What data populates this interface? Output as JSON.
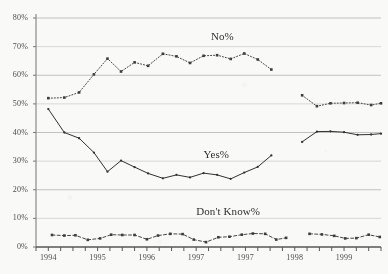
{
  "chart_data": {
    "type": "line",
    "title": "",
    "subtitle": "",
    "xlabel": "",
    "ylabel": "",
    "ylim": [
      0,
      80
    ],
    "xlim": [
      0,
      28
    ],
    "grid": true,
    "legend_position": "inline-annotations",
    "ytick_labels": [
      "0%",
      "10%",
      "20%",
      "30%",
      "40%",
      "50%",
      "60%",
      "70%",
      "80%"
    ],
    "ytick_values": [
      0,
      10,
      20,
      30,
      40,
      50,
      60,
      70,
      80
    ],
    "xtick_labels": [
      "1994",
      "1995",
      "1996",
      "1997",
      "1997",
      "1998",
      "1999"
    ],
    "xtick_positions": [
      1,
      5,
      9,
      13,
      17,
      21,
      25
    ],
    "annotations": [
      {
        "text": "No%",
        "x": 14.2,
        "y": 73.5
      },
      {
        "text": "Yes%",
        "x": 13.6,
        "y": 32.0
      },
      {
        "text": "Don't Know%",
        "x": 13.0,
        "y": 12.4
      }
    ],
    "series": [
      {
        "name": "No%",
        "style": "dotted",
        "marker": "square",
        "color": "#3a3a3a",
        "points": [
          {
            "x": 1.0,
            "y": 52.0
          },
          {
            "x": 2.3,
            "y": 52.2
          },
          {
            "x": 3.5,
            "y": 54.0
          },
          {
            "x": 4.7,
            "y": 60.3
          },
          {
            "x": 5.8,
            "y": 65.8
          },
          {
            "x": 6.9,
            "y": 61.3
          },
          {
            "x": 8.0,
            "y": 64.5
          },
          {
            "x": 9.1,
            "y": 63.3
          },
          {
            "x": 10.3,
            "y": 67.5
          },
          {
            "x": 11.4,
            "y": 66.6
          },
          {
            "x": 12.5,
            "y": 64.3
          },
          {
            "x": 13.6,
            "y": 66.8
          },
          {
            "x": 14.7,
            "y": 67.0
          },
          {
            "x": 15.8,
            "y": 65.7
          },
          {
            "x": 16.9,
            "y": 67.6
          },
          {
            "x": 18.0,
            "y": 65.5
          },
          {
            "x": 19.1,
            "y": 62.0
          }
        ]
      },
      {
        "name": "No%-segment2",
        "style": "dotted",
        "marker": "square",
        "color": "#3a3a3a",
        "points": [
          {
            "x": 21.6,
            "y": 53.0
          },
          {
            "x": 22.8,
            "y": 49.2
          },
          {
            "x": 23.9,
            "y": 50.2
          },
          {
            "x": 25.0,
            "y": 50.3
          },
          {
            "x": 26.1,
            "y": 50.4
          },
          {
            "x": 27.2,
            "y": 49.6
          },
          {
            "x": 28.0,
            "y": 50.2
          }
        ]
      },
      {
        "name": "Yes%",
        "style": "solid",
        "marker": "dot",
        "color": "#2e2e2e",
        "points": [
          {
            "x": 1.0,
            "y": 48.2
          },
          {
            "x": 2.3,
            "y": 40.0
          },
          {
            "x": 3.5,
            "y": 38.0
          },
          {
            "x": 4.7,
            "y": 33.0
          },
          {
            "x": 5.8,
            "y": 26.3
          },
          {
            "x": 6.9,
            "y": 30.2
          },
          {
            "x": 8.0,
            "y": 27.9
          },
          {
            "x": 9.1,
            "y": 25.7
          },
          {
            "x": 10.3,
            "y": 24.0
          },
          {
            "x": 11.4,
            "y": 25.2
          },
          {
            "x": 12.5,
            "y": 24.3
          },
          {
            "x": 13.6,
            "y": 25.8
          },
          {
            "x": 14.7,
            "y": 25.2
          },
          {
            "x": 15.8,
            "y": 23.8
          },
          {
            "x": 16.9,
            "y": 26.0
          },
          {
            "x": 18.0,
            "y": 28.0
          },
          {
            "x": 19.1,
            "y": 32.0
          }
        ]
      },
      {
        "name": "Yes%-segment2",
        "style": "solid",
        "marker": "dot",
        "color": "#2e2e2e",
        "points": [
          {
            "x": 21.6,
            "y": 36.7
          },
          {
            "x": 22.8,
            "y": 40.3
          },
          {
            "x": 23.9,
            "y": 40.4
          },
          {
            "x": 25.0,
            "y": 40.1
          },
          {
            "x": 26.1,
            "y": 39.2
          },
          {
            "x": 27.2,
            "y": 39.3
          },
          {
            "x": 28.0,
            "y": 39.6
          }
        ]
      },
      {
        "name": "Don't Know%",
        "style": "dashed",
        "marker": "square",
        "color": "#3a3a3a",
        "points": [
          {
            "x": 1.3,
            "y": 4.2
          },
          {
            "x": 2.3,
            "y": 4.0
          },
          {
            "x": 3.2,
            "y": 4.1
          },
          {
            "x": 4.2,
            "y": 2.5
          },
          {
            "x": 5.2,
            "y": 3.0
          },
          {
            "x": 6.1,
            "y": 4.3
          },
          {
            "x": 7.0,
            "y": 4.2
          },
          {
            "x": 8.0,
            "y": 4.2
          },
          {
            "x": 9.0,
            "y": 2.7
          },
          {
            "x": 9.9,
            "y": 4.0
          },
          {
            "x": 10.9,
            "y": 4.6
          },
          {
            "x": 11.9,
            "y": 4.5
          },
          {
            "x": 12.8,
            "y": 2.6
          },
          {
            "x": 13.8,
            "y": 1.7
          },
          {
            "x": 14.8,
            "y": 3.4
          },
          {
            "x": 15.7,
            "y": 3.6
          },
          {
            "x": 16.7,
            "y": 4.3
          },
          {
            "x": 17.6,
            "y": 4.7
          },
          {
            "x": 18.6,
            "y": 4.6
          },
          {
            "x": 19.5,
            "y": 2.6
          },
          {
            "x": 20.3,
            "y": 3.2
          }
        ]
      },
      {
        "name": "Don't Know%-segment2",
        "style": "dashed",
        "marker": "square",
        "color": "#3a3a3a",
        "points": [
          {
            "x": 22.2,
            "y": 4.6
          },
          {
            "x": 23.2,
            "y": 4.4
          },
          {
            "x": 24.2,
            "y": 3.9
          },
          {
            "x": 25.1,
            "y": 3.0
          },
          {
            "x": 26.0,
            "y": 3.1
          },
          {
            "x": 27.0,
            "y": 4.3
          },
          {
            "x": 27.9,
            "y": 3.5
          }
        ]
      }
    ]
  },
  "axis": {
    "axis_color": "#9a9a9a",
    "grid_color": "#b9b9b9"
  }
}
